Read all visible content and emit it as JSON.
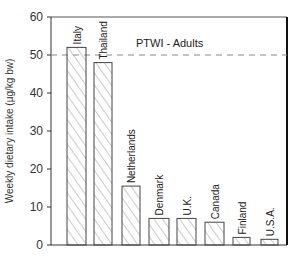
{
  "chart_data": {
    "type": "bar",
    "title": "",
    "xlabel": "",
    "ylabel": "Weekly dietary intake (μg/kg bw)",
    "categories": [
      "Italy",
      "Thailand",
      "Netherlands",
      "Denmark",
      "U.K.",
      "Canada",
      "Finland",
      "U.S.A."
    ],
    "values": [
      52,
      48,
      15.5,
      7,
      7,
      6,
      2,
      1.5
    ],
    "ylim": [
      0,
      60
    ],
    "yticks": [
      0,
      10,
      20,
      30,
      40,
      50,
      60
    ],
    "grid": false,
    "legend": null,
    "bar_fill": "diagonal-hatch",
    "reference_line": {
      "value": 50,
      "label": "PTWI - Adults",
      "style": "dashed"
    },
    "category_label_orientation": "vertical, above bars"
  },
  "colors": {
    "axis": "#222222",
    "bar_edge": "#444444",
    "hatch": "#777777",
    "reference_line": "#888888"
  }
}
